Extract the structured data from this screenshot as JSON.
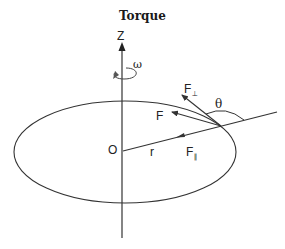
{
  "title": "Torque",
  "labels": {
    "axis": "Z",
    "angular_velocity": "ω",
    "origin": "O",
    "radius": "r",
    "force": "F",
    "force_perp_base": "F",
    "force_perp_sub": "⊥",
    "force_parallel_base": "F",
    "force_parallel_sub": "∥",
    "angle": "θ"
  },
  "colors": {
    "stroke": "#333333",
    "text": "#222222",
    "background": "#ffffff"
  }
}
